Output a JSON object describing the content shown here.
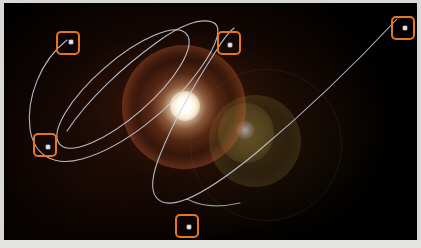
{
  "image": {
    "title": "Annotated star system with planetary orbits",
    "background_color": "#000000",
    "border_color": "#d8d8d6",
    "alt_text": "Dark astronomical image of a bright star with lens flare and two traced orbital paths"
  },
  "star": {
    "name": "central-star",
    "core_color": "#ffffff",
    "glow_color": "#ffd9b0",
    "halo_ring_color": "#d66838",
    "center_x": 181,
    "center_y": 103
  },
  "lens_flare": {
    "name": "secondary-lens-flare",
    "color": "#b0a04c",
    "center_x": 241,
    "center_y": 130
  },
  "orbits": [
    {
      "name": "inner-elliptical-orbit",
      "type": "ellipse",
      "stroke_color": "#c9d2e0",
      "stroke_width": 1.1,
      "label": "Orbit 1"
    },
    {
      "name": "outer-arc-orbit",
      "type": "open-arc",
      "stroke_color": "#c9d2e0",
      "stroke_width": 1.1,
      "label": "Orbit 2"
    }
  ],
  "annotations": {
    "box_color": "#e8761c",
    "box_stroke_width": 2,
    "count": 5,
    "boxes": [
      {
        "id": "annotation-1",
        "label": "Planet marker top-left",
        "x": 52,
        "y": 28,
        "w": 24,
        "h": 24,
        "marker_x": 13,
        "marker_y": 9
      },
      {
        "id": "annotation-2",
        "label": "Planet marker top-center",
        "x": 213,
        "y": 28,
        "w": 24,
        "h": 24,
        "marker_x": 11,
        "marker_y": 12
      },
      {
        "id": "annotation-3",
        "label": "Planet marker top-right",
        "x": 387,
        "y": 13,
        "w": 24,
        "h": 24,
        "marker_x": 12,
        "marker_y": 10
      },
      {
        "id": "annotation-4",
        "label": "Planet marker left-lower",
        "x": 29,
        "y": 130,
        "w": 24,
        "h": 24,
        "marker_x": 13,
        "marker_y": 12
      },
      {
        "id": "annotation-5",
        "label": "Planet marker bottom",
        "x": 171,
        "y": 211,
        "w": 24,
        "h": 24,
        "marker_x": 12,
        "marker_y": 11
      }
    ]
  }
}
